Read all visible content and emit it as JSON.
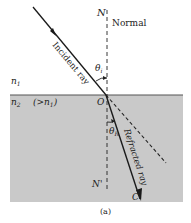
{
  "figure": {
    "caption": "(a)",
    "colors": {
      "medium2_fill": "#c9c9c9",
      "line": "#1a1a1a",
      "interface": "#555555"
    }
  },
  "labels": {
    "normal_top": "N",
    "normal_bottom": "N'",
    "normal_text": "Normal",
    "incident_ray": "Incident ray",
    "refracted_ray": "Refracted ray",
    "theta_i": "θ",
    "theta_i_sub": "i",
    "theta_r": "θ",
    "theta_r_sub": "R",
    "origin": "O",
    "end_point": "C",
    "n1": "n",
    "n1_sub": "1",
    "n2": "n",
    "n2_sub": "2",
    "n2_relation": "(>n",
    "n2_relation_sub": "1",
    "n2_relation_close": ")"
  }
}
